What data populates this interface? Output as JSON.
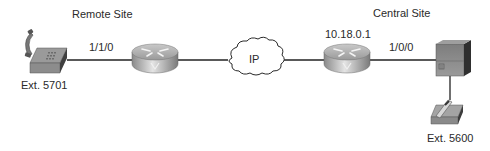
{
  "diagram": {
    "sites": {
      "remote": {
        "label": "Remote Site"
      },
      "central": {
        "label": "Central Site"
      }
    },
    "nodes": {
      "phone_remote": {
        "type": "phone-icon",
        "label": "Ext. 5701"
      },
      "router_remote": {
        "type": "voice-router-icon",
        "label": ""
      },
      "cloud": {
        "type": "ip-cloud-icon",
        "label": "IP"
      },
      "router_central": {
        "type": "voice-router-icon",
        "label": "10.18.0.1"
      },
      "pbx_central": {
        "type": "pbx-switch-icon",
        "label": ""
      },
      "phone_central": {
        "type": "phone-icon",
        "label": "Ext. 5600"
      }
    },
    "links": {
      "remote_port": {
        "from": "phone_remote",
        "to": "router_remote",
        "label": "1/1/0"
      },
      "remote_wan": {
        "from": "router_remote",
        "to": "cloud",
        "label": ""
      },
      "central_wan": {
        "from": "cloud",
        "to": "router_central",
        "label": ""
      },
      "central_port": {
        "from": "router_central",
        "to": "pbx_central",
        "label": "1/0/0"
      },
      "pbx_phone": {
        "from": "pbx_central",
        "to": "phone_central",
        "label": ""
      }
    }
  }
}
